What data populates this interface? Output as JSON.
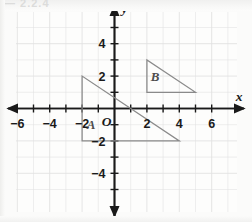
{
  "figure": {
    "background_color": "#fbfbfa",
    "grid_color": "#e2e2e2",
    "axis_color": "#1a1a1a",
    "shape_color": "#8a8a8a",
    "label_color": "#1a1a1a"
  },
  "axes": {
    "x_axis_label": "x",
    "y_axis_label": "y",
    "origin_label": "O",
    "x_tick_labels": [
      "−6",
      "−4",
      "−2",
      "2",
      "4",
      "6"
    ],
    "x_tick_values": [
      -6,
      -4,
      -2,
      2,
      4,
      6
    ],
    "y_tick_labels": [
      "4",
      "2",
      "−2",
      "−4"
    ],
    "y_tick_values": [
      4,
      2,
      -2,
      -4
    ],
    "x_range": [
      -7,
      7
    ],
    "y_range": [
      -5.5,
      5.5
    ],
    "grid_visible": true,
    "grid_step": 1,
    "minor_tick_step": 1,
    "arrowheads": [
      "left",
      "right",
      "up",
      "down"
    ]
  },
  "shapes": [
    {
      "name": "triangle-a",
      "label": "A",
      "label_position": {
        "x": -1.45,
        "y": -1.25
      },
      "vertices": [
        {
          "x": -2,
          "y": 2
        },
        {
          "x": -2,
          "y": -2
        },
        {
          "x": 4,
          "y": -2
        }
      ]
    },
    {
      "name": "triangle-b",
      "label": "B",
      "label_position": {
        "x": 2.5,
        "y": 1.7
      },
      "vertices": [
        {
          "x": 2,
          "y": 3
        },
        {
          "x": 2,
          "y": 1
        },
        {
          "x": 5,
          "y": 1
        }
      ]
    }
  ],
  "chart_data": {
    "type": "scatter",
    "title": "",
    "xlabel": "x",
    "ylabel": "y",
    "xlim": [
      -7,
      7
    ],
    "ylim": [
      -5.5,
      5.5
    ],
    "grid": true,
    "legend": "none",
    "annotations": [
      {
        "text": "A",
        "x": -1.45,
        "y": -1.25
      },
      {
        "text": "B",
        "x": 2.5,
        "y": 1.7
      }
    ],
    "series": [
      {
        "name": "Triangle A",
        "type": "polygon",
        "x": [
          -2,
          -2,
          4,
          -2
        ],
        "y": [
          2,
          -2,
          -2,
          2
        ]
      },
      {
        "name": "Triangle B",
        "type": "polygon",
        "x": [
          2,
          2,
          5,
          2
        ],
        "y": [
          3,
          1,
          1,
          3
        ]
      }
    ]
  },
  "artifact": {
    "top_text": "— 2.2.4"
  }
}
